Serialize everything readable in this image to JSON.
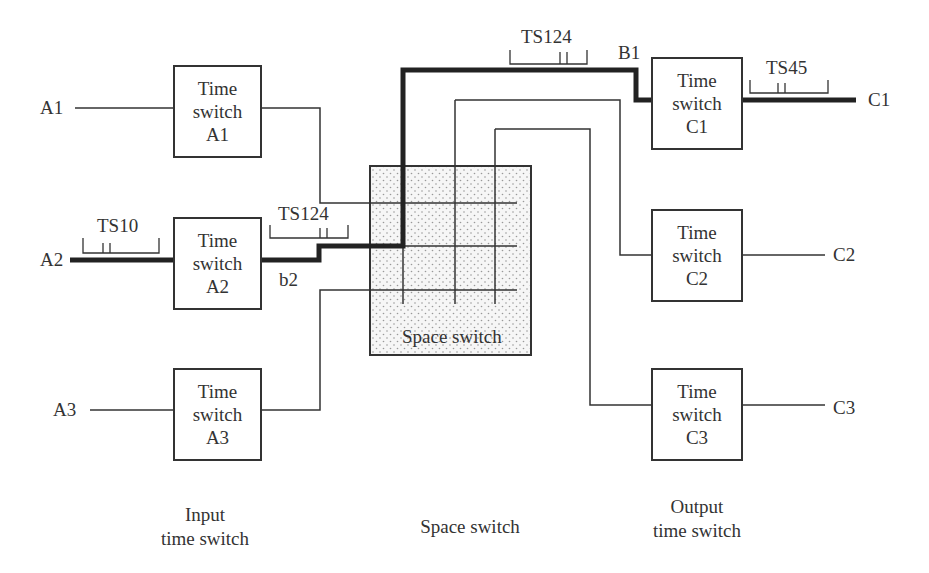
{
  "diagram": {
    "input_switches": [
      {
        "id": "A1",
        "line1": "Time",
        "line2": "switch",
        "line3": "A1",
        "input_label": "A1"
      },
      {
        "id": "A2",
        "line1": "Time",
        "line2": "switch",
        "line3": "A2",
        "input_label": "A2"
      },
      {
        "id": "A3",
        "line1": "Time",
        "line2": "switch",
        "line3": "A3",
        "input_label": "A3"
      }
    ],
    "output_switches": [
      {
        "id": "C1",
        "line1": "Time",
        "line2": "switch",
        "line3": "C1",
        "output_label": "C1"
      },
      {
        "id": "C2",
        "line1": "Time",
        "line2": "switch",
        "line3": "C2",
        "output_label": "C2"
      },
      {
        "id": "C3",
        "line1": "Time",
        "line2": "switch",
        "line3": "C3",
        "output_label": "C3"
      }
    ],
    "space_switch_label": "Space switch",
    "timeslot_labels": {
      "input_a2": "TS10",
      "link_b2": "TS124",
      "link_b1": "TS124",
      "output_c1": "TS45"
    },
    "link_labels": {
      "b2": "b2",
      "B1": "B1"
    },
    "captions": {
      "input": {
        "line1": "Input",
        "line2": "time switch"
      },
      "space": {
        "line1": "Space switch"
      },
      "output": {
        "line1": "Output",
        "line2": "time switch"
      }
    },
    "colors": {
      "line": "#333333",
      "highlight_path": "#222222",
      "space_switch_fill": "#f2f2f2"
    }
  }
}
